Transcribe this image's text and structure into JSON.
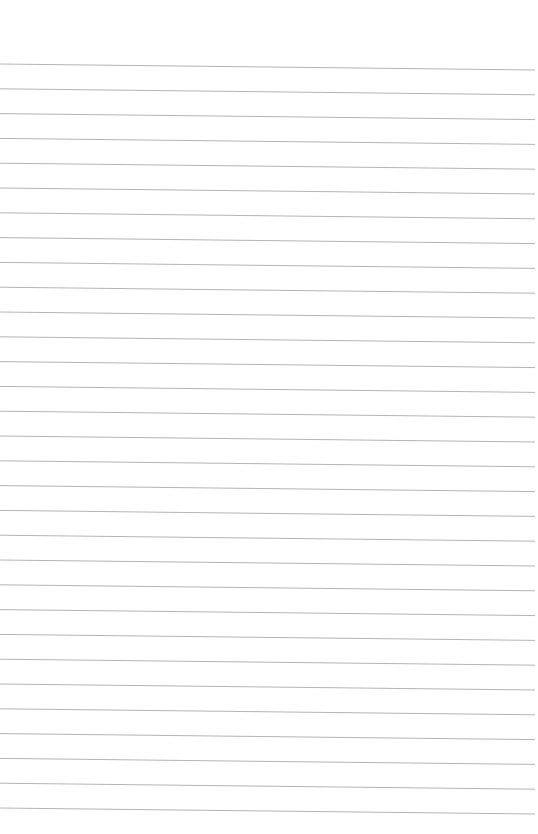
{
  "page": {
    "type": "lined-paper",
    "background_color": "#ffffff",
    "line_color": "#b4b4b4",
    "line_count": 31,
    "first_line_y_left": 64,
    "first_line_y_right": 70,
    "line_spacing": 24.8,
    "line_x_start": 0,
    "line_x_end": 535
  }
}
